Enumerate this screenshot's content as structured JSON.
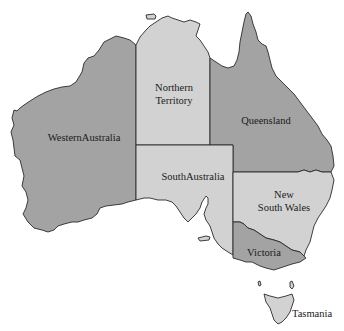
{
  "map": {
    "title": "",
    "colors": {
      "dark_region": "#a3a3a3",
      "light_region": "#d2d2d2",
      "outline": "#2a2a2a",
      "background": "#ffffff"
    },
    "regions": [
      {
        "id": "western-australia",
        "label": "WesternAustralia",
        "line1": "WesternAustralia",
        "line2": "",
        "shade": "dark"
      },
      {
        "id": "northern-territory",
        "label": "Northern Territory",
        "line1": "Northern",
        "line2": "Territory",
        "shade": "light"
      },
      {
        "id": "queensland",
        "label": "Queensland",
        "line1": "Queensland",
        "line2": "",
        "shade": "dark"
      },
      {
        "id": "south-australia",
        "label": "SouthAustralia",
        "line1": "SouthAustralia",
        "line2": "",
        "shade": "light"
      },
      {
        "id": "new-south-wales",
        "label": "New South Wales",
        "line1": "New",
        "line2": "South Wales",
        "shade": "light"
      },
      {
        "id": "victoria",
        "label": "Victoria",
        "line1": "Victoria",
        "line2": "",
        "shade": "dark"
      },
      {
        "id": "tasmania",
        "label": "Tasmania",
        "line1": "Tasmania",
        "line2": "",
        "shade": "light"
      }
    ]
  }
}
